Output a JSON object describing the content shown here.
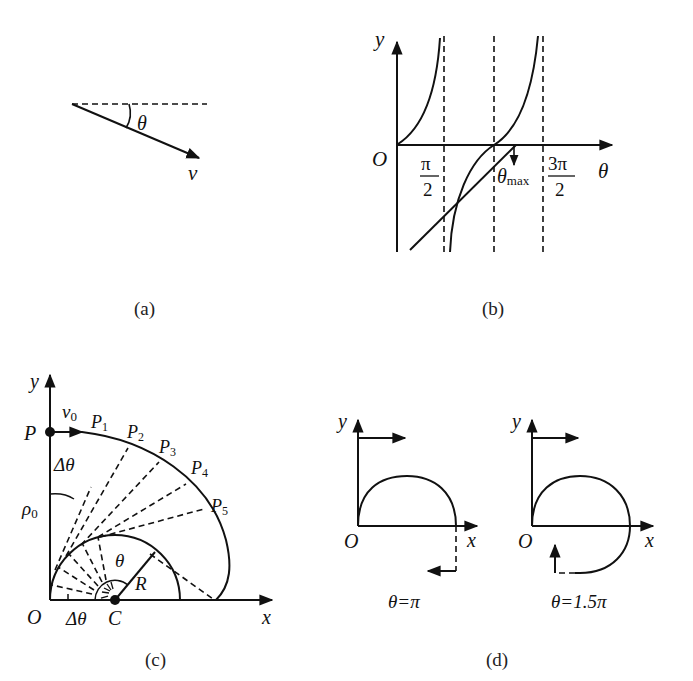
{
  "panels": {
    "a": {
      "caption": "(a)",
      "angle_label": "θ",
      "vector_label": "v"
    },
    "b": {
      "caption": "(b)",
      "y_axis": "y",
      "x_axis": "θ",
      "origin": "O",
      "tick_1_num": "π",
      "tick_1_den": "2",
      "tick_2_num": "3π",
      "tick_2_den": "2",
      "theta_max_main": "θ",
      "theta_max_sub": "max"
    },
    "c": {
      "caption": "(c)",
      "y_axis": "y",
      "x_axis": "x",
      "origin": "O",
      "center": "C",
      "point_P": "P",
      "velocity": "v",
      "velocity_sub": "0",
      "rho": "ρ",
      "rho_sub": "0",
      "delta_theta_top": "Δθ",
      "delta_theta_bottom": "Δθ",
      "theta": "θ",
      "radius": "R",
      "points": [
        {
          "main": "P",
          "sub": "1"
        },
        {
          "main": "P",
          "sub": "2"
        },
        {
          "main": "P",
          "sub": "3"
        },
        {
          "main": "P",
          "sub": "4"
        },
        {
          "main": "P",
          "sub": "5"
        }
      ]
    },
    "d": {
      "caption": "(d)",
      "left": {
        "y_axis": "y",
        "x_axis": "x",
        "origin": "O",
        "label": "θ=π"
      },
      "right": {
        "y_axis": "y",
        "x_axis": "x",
        "origin": "O",
        "label": "θ=1.5π"
      }
    }
  }
}
